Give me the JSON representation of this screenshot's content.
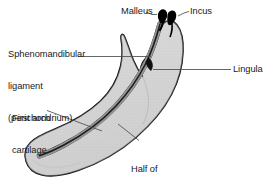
{
  "figure": {
    "kind": "anatomical-diagram",
    "background_color": "#ffffff",
    "colors": {
      "bone_fill": "#d4d4d4",
      "bone_outline": "#111111",
      "cartilage": "#141414",
      "leader_line": "#4d4d4d",
      "text": "#1a1a1a",
      "ossicle": "#000000"
    }
  },
  "labels": {
    "sphenomandibular": {
      "line1": "Sphenomandibular",
      "line2": "ligament",
      "line3": "(perichondrium)"
    },
    "malleus": "Malleus",
    "incus": "Incus",
    "lingula": "Lingula",
    "first_arch": {
      "line1": "First arch",
      "line2": "cartilage"
    },
    "half_of_mandible": {
      "line1": "Half of",
      "line2": "mandible"
    }
  },
  "structures": [
    {
      "name": "mandible-body",
      "label": "Half of mandible"
    },
    {
      "name": "coronoid-process",
      "label": "Coronoid process"
    },
    {
      "name": "condylar-process",
      "label": "Condylar process"
    },
    {
      "name": "meckels-cartilage",
      "label": "First arch cartilage"
    },
    {
      "name": "sphenomandibular-ligament",
      "label": "Sphenomandibular ligament (perichondrium)"
    },
    {
      "name": "lingula",
      "label": "Lingula"
    },
    {
      "name": "malleus-ossicle",
      "label": "Malleus"
    },
    {
      "name": "incus-ossicle",
      "label": "Incus"
    }
  ]
}
